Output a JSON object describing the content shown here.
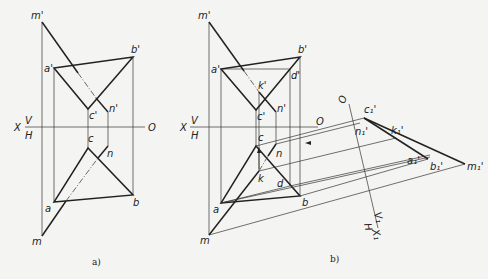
{
  "figure_a": {
    "caption": "a)",
    "axis": {
      "x_label": "X",
      "v_label": "V",
      "h_label": "H",
      "o_label": "O"
    },
    "points": {
      "m_prime": "m'",
      "a_prime": "a'",
      "b_prime": "b'",
      "c_prime": "c'",
      "n_prime": "n'",
      "a": "a",
      "b": "b",
      "c": "c",
      "n": "n",
      "m": "m"
    }
  },
  "figure_b": {
    "caption": "b)",
    "axis": {
      "x_label": "X",
      "v_label": "V",
      "h_label": "H",
      "o_label": "O",
      "o1_label": "O",
      "x1_label": "X₁",
      "v1_label": "V₁",
      "h1_label": "H"
    },
    "points": {
      "m_prime": "m'",
      "a_prime": "a'",
      "b_prime": "b'",
      "c_prime": "c'",
      "n_prime": "n'",
      "d_prime": "d'",
      "k_prime": "k'",
      "a": "a",
      "b": "b",
      "c": "c",
      "n": "n",
      "m": "m",
      "k": "k",
      "d": "d",
      "c1": "c₁'",
      "n1": "n₁'",
      "k1": "k₁'",
      "a1": "a₁'",
      "b1": "b₁'",
      "m1": "m₁'"
    }
  }
}
